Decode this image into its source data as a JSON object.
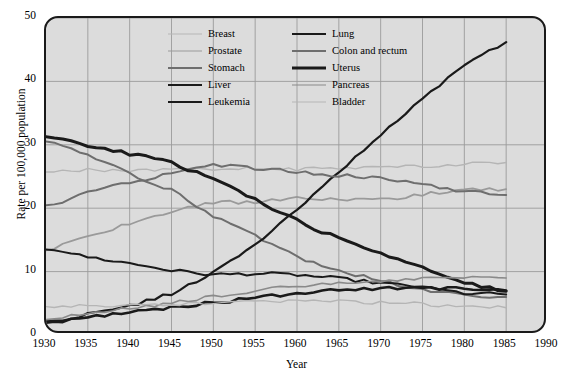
{
  "chart_data": {
    "type": "line",
    "title": "",
    "xlabel": "Year",
    "ylabel": "Rate per 100,000 population",
    "xlim": [
      1930,
      1990
    ],
    "ylim": [
      0,
      50
    ],
    "xticks": [
      1930,
      1935,
      1940,
      1945,
      1950,
      1955,
      1960,
      1965,
      1970,
      1975,
      1980,
      1985,
      1990
    ],
    "yticks": [
      0,
      10,
      20,
      30,
      40,
      50
    ],
    "grid": true,
    "legend_position": "top-center-inside",
    "x": [
      1930,
      1935,
      1940,
      1945,
      1950,
      1955,
      1960,
      1965,
      1970,
      1975,
      1980,
      1985
    ],
    "series": [
      {
        "name": "Breast",
        "color": "#b5b5b5",
        "width": 1.4,
        "values": [
          25.8,
          26.1,
          25.9,
          26.2,
          26.0,
          26.3,
          26.1,
          26.4,
          26.5,
          26.6,
          27.0,
          27.2
        ]
      },
      {
        "name": "Prostate",
        "color": "#9a9a9a",
        "width": 1.8,
        "values": [
          13.4,
          15.4,
          17.6,
          19.4,
          21.0,
          20.8,
          21.7,
          21.4,
          21.3,
          22.2,
          22.9,
          23.0
        ]
      },
      {
        "name": "Stomach",
        "color": "#6e6e6e",
        "width": 2.0,
        "values": [
          30.5,
          28.4,
          25.4,
          22.8,
          18.8,
          15.6,
          12.3,
          10.2,
          8.5,
          7.2,
          6.3,
          6.0
        ]
      },
      {
        "name": "Liver",
        "color": "#1a1a1a",
        "width": 2.0,
        "values": [
          13.4,
          12.3,
          11.3,
          10.2,
          9.5,
          9.7,
          9.5,
          8.9,
          8.2,
          7.5,
          6.6,
          6.4
        ]
      },
      {
        "name": "Leukemia",
        "color": "#1a1a1a",
        "width": 2.6,
        "values": [
          1.8,
          2.8,
          3.6,
          4.4,
          5.1,
          5.8,
          6.6,
          7.1,
          7.4,
          7.5,
          7.3,
          7.0
        ]
      },
      {
        "name": "Lung",
        "color": "#1a1a1a",
        "width": 2.2,
        "values": [
          2.0,
          3.2,
          4.6,
          6.5,
          9.8,
          14.3,
          19.8,
          25.6,
          31.6,
          37.2,
          42.5,
          46.2
        ]
      },
      {
        "name": "Colon and rectum",
        "color": "#6e6e6e",
        "width": 2.0,
        "values": [
          20.2,
          22.4,
          24.1,
          25.4,
          26.9,
          26.3,
          25.7,
          25.2,
          24.7,
          23.8,
          22.6,
          22.1
        ]
      },
      {
        "name": "Uterus",
        "color": "#1a1a1a",
        "width": 3.0,
        "values": [
          31.5,
          29.9,
          28.6,
          27.2,
          24.6,
          21.4,
          18.0,
          15.2,
          12.8,
          10.5,
          8.2,
          6.9
        ]
      },
      {
        "name": "Pancreas",
        "color": "#8a8a8a",
        "width": 1.6,
        "values": [
          2.6,
          3.3,
          4.2,
          5.0,
          6.1,
          7.0,
          7.7,
          8.1,
          8.6,
          8.9,
          9.1,
          9.0
        ]
      },
      {
        "name": "Bladder",
        "color": "#b5b5b5",
        "width": 1.4,
        "values": [
          4.6,
          4.6,
          4.7,
          4.8,
          5.0,
          5.2,
          5.4,
          5.3,
          5.1,
          4.9,
          4.5,
          4.3
        ]
      }
    ]
  },
  "legend": {
    "columns": [
      [
        "Breast",
        "Prostate",
        "Stomach",
        "Liver",
        "Leukemia"
      ],
      [
        "Lung",
        "Colon and rectum",
        "Uterus",
        "Pancreas",
        "Bladder"
      ]
    ]
  },
  "axes": {
    "y_title": "Rate per 100,000 population",
    "x_title": "Year",
    "y_tick_labels": [
      "50",
      "40",
      "30",
      "20",
      "10",
      "0"
    ],
    "x_tick_labels": [
      "1930",
      "1935",
      "1940",
      "1945",
      "1950",
      "1955",
      "1960",
      "1965",
      "1970",
      "1975",
      "1980",
      "1985",
      "1990"
    ]
  },
  "colors": {
    "plot_background": "#dcdcdc",
    "frame": "#1a1a1a",
    "gridline": "#9b9b9b",
    "page_background": "#ffffff"
  }
}
